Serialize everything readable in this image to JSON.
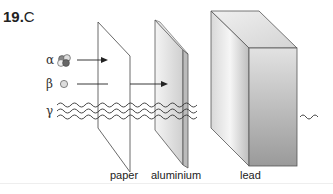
{
  "question": {
    "number": "19.",
    "answer": "C"
  },
  "radiation": [
    {
      "symbol": "α",
      "name": "alpha",
      "stopped_by": "paper"
    },
    {
      "symbol": "β",
      "name": "beta",
      "stopped_by": "aluminium"
    },
    {
      "symbol": "γ",
      "name": "gamma",
      "stopped_by": "lead (reduced)"
    }
  ],
  "barriers": [
    {
      "label": "paper"
    },
    {
      "label": "aluminium"
    },
    {
      "label": "lead"
    }
  ]
}
